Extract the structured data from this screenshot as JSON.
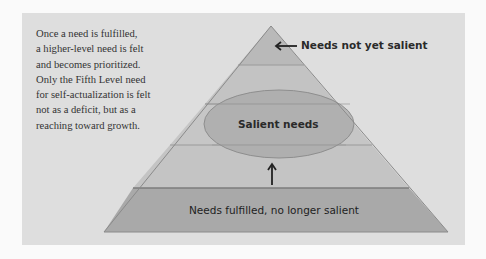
{
  "caption": {
    "lines": [
      "Once a need is fulfilled,",
      "a higher-level need is felt",
      "and becomes prioritized.",
      "Only the Fifth Level need",
      "for self-actualization is felt",
      "not as a deficit, but as a",
      "reaching toward growth."
    ]
  },
  "labels": {
    "top": "Needs not yet salient",
    "middle": "Salient needs",
    "bottom": "Needs fulfilled, no longer salient"
  },
  "colors": {
    "panel": "#dedede",
    "layer_top": "#b4b4b4",
    "layer_light": "#c4c4c4",
    "layer_bottom": "#a9a9a9",
    "ellipse": "#a8a8a8",
    "line": "#8a8a8a"
  }
}
